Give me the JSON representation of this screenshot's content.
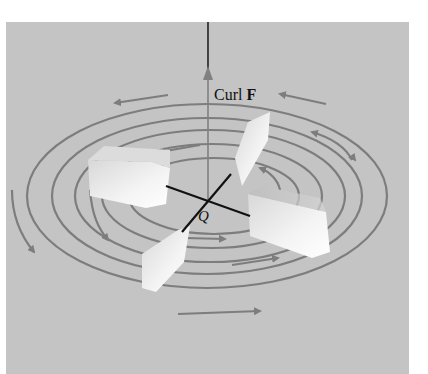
{
  "figure": {
    "type": "paddle-wheel curl illustration",
    "curl_label_prefix": "Curl ",
    "curl_label_vector": "F",
    "point_label": "Q",
    "colors": {
      "background": "#c4c4c4",
      "flow_lines": "#7d7d7d",
      "axis_line": "#3a3a3a",
      "paddle_axle": "#111111",
      "paddle_face": "#efefef"
    },
    "elements": [
      "vertical axis arrow (curl F) through point Q",
      "concentric elliptical flow lines circulating counterclockwise",
      "paddle wheel with four square vanes centered at Q"
    ]
  }
}
